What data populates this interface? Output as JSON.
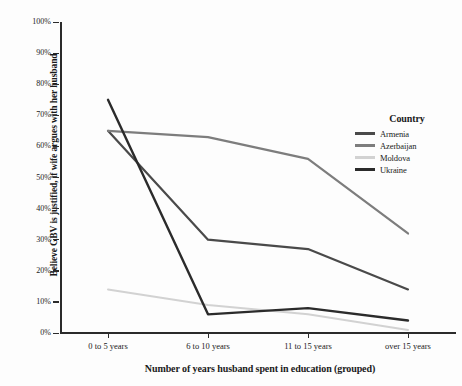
{
  "chart_data": {
    "type": "line",
    "title": "",
    "xlabel": "Number of years husband spent in education (grouped)",
    "ylabel": "Believe GBV is justified, if wife argues with her husband",
    "categories": [
      "0 to 5 years",
      "6 to 10 years",
      "11 to 15 years",
      "over 15 years"
    ],
    "ylim": [
      0,
      100
    ],
    "ytick_labels": [
      "0%",
      "10%",
      "20%",
      "30%",
      "40%",
      "50%",
      "60%",
      "70%",
      "80%",
      "90%",
      "100%"
    ],
    "ytick_values": [
      0,
      10,
      20,
      30,
      40,
      50,
      60,
      70,
      80,
      90,
      100
    ],
    "grid": false,
    "legend_position": "right",
    "legend_title": "Country",
    "series": [
      {
        "name": "Armenia",
        "values": [
          65,
          30,
          27,
          14
        ],
        "color": "#4a4a4a"
      },
      {
        "name": "Azerbaijan",
        "values": [
          65,
          63,
          56,
          32
        ],
        "color": "#7d7d7d"
      },
      {
        "name": "Moldova",
        "values": [
          14,
          9,
          6,
          1
        ],
        "color": "#d2d2d2"
      },
      {
        "name": "Ukraine",
        "values": [
          75,
          6,
          8,
          4
        ],
        "color": "#2b2b2b"
      }
    ]
  },
  "axes": {
    "x_title": "Number of years husband spent in education (grouped)",
    "y_title": "Believe GBV is justified, if wife argues with her husband"
  },
  "legend": {
    "title": "Country",
    "items": [
      {
        "label": "Armenia"
      },
      {
        "label": "Azerbaijan"
      },
      {
        "label": "Moldova"
      },
      {
        "label": "Ukraine"
      }
    ]
  }
}
